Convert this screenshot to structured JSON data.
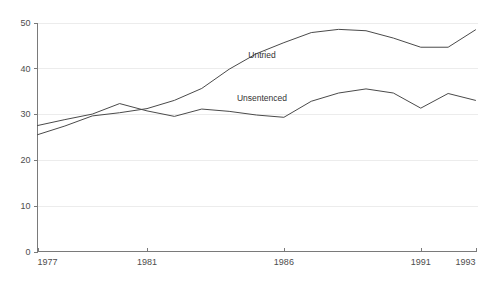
{
  "chart_data": {
    "type": "line",
    "title": "",
    "subtitle": "",
    "xlabel": "",
    "ylabel": "",
    "xlim": [
      1977,
      1993
    ],
    "ylim": [
      0,
      50
    ],
    "grid": "horizontal",
    "legend_position": "inline-annotations",
    "x_tick_labels": [
      "1977",
      "1981",
      "1986",
      "1991",
      "1993"
    ],
    "x_tick_values": [
      1977,
      1981,
      1986,
      1991,
      1993
    ],
    "y_tick_labels": [
      "0",
      "10",
      "20",
      "30",
      "40",
      "50"
    ],
    "y_tick_values": [
      0,
      10,
      20,
      30,
      40,
      50
    ],
    "x": [
      1977,
      1978,
      1979,
      1980,
      1981,
      1982,
      1983,
      1984,
      1985,
      1986,
      1987,
      1988,
      1989,
      1990,
      1991,
      1992,
      1993
    ],
    "series": [
      {
        "name": "Untried",
        "label": "Untried",
        "color": "#4a4a4a",
        "annotation_x": 1985.2,
        "annotation_y": 42.2,
        "values": [
          25.5,
          27.4,
          29.6,
          30.3,
          31.2,
          33.0,
          35.6,
          39.8,
          43.2,
          45.6,
          47.8,
          48.5,
          48.2,
          46.6,
          44.6,
          44.6,
          48.4
        ]
      },
      {
        "name": "Unsentenced",
        "label": "Unsentenced",
        "color": "#4a4a4a",
        "annotation_x": 1985.2,
        "annotation_y": 32.9,
        "values": [
          27.5,
          28.8,
          30.0,
          32.3,
          30.7,
          29.5,
          31.1,
          30.6,
          29.8,
          29.3,
          32.8,
          34.6,
          35.5,
          34.6,
          31.3,
          34.5,
          33.0
        ]
      }
    ]
  },
  "axes": {
    "y_axis_name": "value-axis",
    "x_axis_name": "year-axis"
  }
}
